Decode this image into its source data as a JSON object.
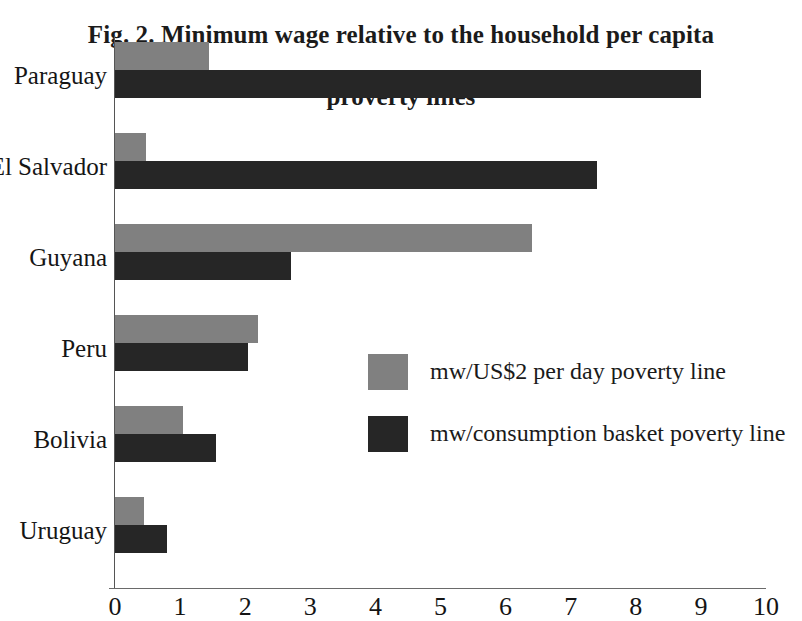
{
  "chart_data": {
    "type": "bar",
    "orientation": "horizontal",
    "title": "Fig. 2. Minimum wage relative to the household per capita",
    "title_line1": "Fig. 2. Minimum wage relative to the household per capita",
    "title_line2": "proverty lines",
    "subtitle": "proverty lines",
    "xlabel": "",
    "ylabel": "",
    "xlim": [
      0,
      10
    ],
    "xticks": [
      "0",
      "1",
      "2",
      "3",
      "4",
      "5",
      "6",
      "7",
      "8",
      "9",
      "10"
    ],
    "grid": false,
    "legend_position": "center-right",
    "categories": [
      "Paraguay",
      "El Salvador",
      "Guyana",
      "Peru",
      "Bolivia",
      "Uruguay"
    ],
    "series": [
      {
        "name": "mw/US$2 per day poverty line",
        "color": "#808080",
        "values": [
          1.45,
          0.48,
          6.4,
          2.2,
          1.05,
          0.45
        ]
      },
      {
        "name": "mw/consumption basket poverty line",
        "color": "#262626",
        "values": [
          9.0,
          7.4,
          2.7,
          2.05,
          1.55,
          0.8
        ]
      }
    ]
  },
  "legend": {
    "items": [
      {
        "label": "mw/US$2 per day poverty line",
        "color": "#808080"
      },
      {
        "label": "mw/consumption basket poverty line",
        "color": "#262626"
      }
    ]
  },
  "axis": {
    "x_ticks": [
      "0",
      "1",
      "2",
      "3",
      "4",
      "5",
      "6",
      "7",
      "8",
      "9",
      "10"
    ],
    "y_categories": [
      "Paraguay",
      "El Salvador",
      "Guyana",
      "Peru",
      "Bolivia",
      "Uruguay"
    ]
  },
  "colors": {
    "series_light": "#808080",
    "series_dark": "#262626",
    "axis": "#6a6a6a",
    "text": "#1a1a1a",
    "background": "#ffffff"
  }
}
